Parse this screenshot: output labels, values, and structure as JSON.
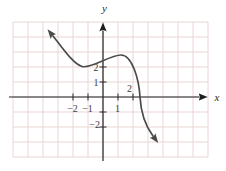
{
  "figure": {
    "kind": "math-function-graph",
    "axes": {
      "x_label": "x",
      "y_label": "y"
    },
    "x_tick_labels": {
      "neg2": "−2",
      "neg1": "−1",
      "pos1": "1",
      "pos2": "2"
    },
    "y_tick_labels": {
      "pos2": "2",
      "pos1": "1",
      "neg2": "−2"
    },
    "colors": {
      "grid_line": "#e9d5d5",
      "axis": "#222222",
      "curve": "#4a4a4a",
      "tick_label": "#3d3d3d",
      "background": "#ffffff"
    }
  },
  "chart_data": {
    "type": "line",
    "title": "",
    "xlabel": "x",
    "ylabel": "y",
    "x_ticks_labeled": [
      -2,
      -1,
      1,
      2
    ],
    "y_ticks_labeled": [
      2,
      1,
      -2
    ],
    "y_ticks_unlabeled": [
      -1
    ],
    "xlim": [
      -6,
      7
    ],
    "ylim": [
      -4.1,
      5
    ],
    "grid": true,
    "legend": false,
    "series": [
      {
        "name": "decreasing cubic-like curve",
        "points_xy": [
          [
            -3.3,
            4.1
          ],
          [
            -2.7,
            3.3
          ],
          [
            -2.4,
            2.9
          ],
          [
            -1.4,
            2.0
          ],
          [
            -0.15,
            2.35
          ],
          [
            1.2,
            2.8
          ],
          [
            2.1,
            1.9
          ],
          [
            2.5,
            0
          ],
          [
            2.8,
            -1.55
          ],
          [
            3.3,
            -2.6
          ],
          [
            3.7,
            -3.1
          ]
        ],
        "local_min_xy": [
          -1.2,
          2.0
        ],
        "local_max_xy": [
          1.2,
          2.8
        ],
        "x_intercept": 2.5,
        "y_intercept": 2.4,
        "arrows_both_ends": true
      }
    ]
  }
}
